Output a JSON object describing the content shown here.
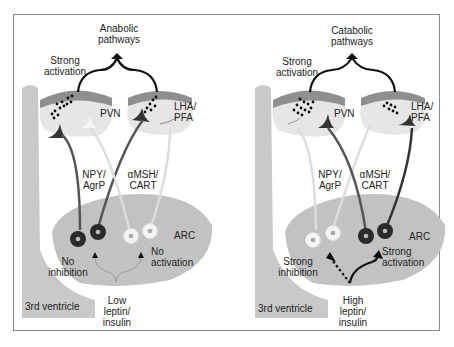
{
  "figure": {
    "colors": {
      "ventricle": "#c9c9c9",
      "arc_region": "#c2c2c2",
      "nucleus_top": "#8f8f8f",
      "nucleus_body": "#e4e4e4",
      "active_neuron": "#2a2a2a",
      "inactive_neuron": "#f4f4f4",
      "axon_dark": "#3a3a3a",
      "axon_light": "#eaeaea",
      "arrow": "#111111"
    },
    "left_panel": {
      "output_label_line1": "Anabolic",
      "output_label_line2": "pathways",
      "activation_line1": "Strong",
      "activation_line2": "activation",
      "pvn_label": "PVN",
      "lha_line1": "LHA/",
      "lha_line2": "PFA",
      "npy_line1": "NPY/",
      "npy_line2": "AgrP",
      "msh_line1": "αMSH/",
      "msh_line2": "CART",
      "arc_label": "ARC",
      "npy_effect_line1": "No",
      "npy_effect_line2": "inhibition",
      "pomc_effect_line1": "No",
      "pomc_effect_line2": "activation",
      "signal_line1": "Low",
      "signal_line2": "leptin/",
      "signal_line3": "insulin",
      "ventricle_label": "3rd ventricle",
      "active_group": "NPY/AgrP",
      "inactive_group": "αMSH/CART"
    },
    "right_panel": {
      "output_label_line1": "Catabolic",
      "output_label_line2": "pathways",
      "activation_line1": "Strong",
      "activation_line2": "activation",
      "pvn_label": "PVN",
      "lha_line1": "LHA/",
      "lha_line2": "PFA",
      "npy_line1": "NPY/",
      "npy_line2": "AgrP",
      "msh_line1": "αMSH/",
      "msh_line2": "CART",
      "arc_label": "ARC",
      "npy_effect_line1": "Strong",
      "npy_effect_line2": "inhibition",
      "pomc_effect_line1": "Strong",
      "pomc_effect_line2": "activation",
      "signal_line1": "High",
      "signal_line2": "leptin/",
      "signal_line3": "insulin",
      "ventricle_label": "3rd ventricle",
      "active_group": "αMSH/CART",
      "inactive_group": "NPY/AgrP"
    }
  }
}
